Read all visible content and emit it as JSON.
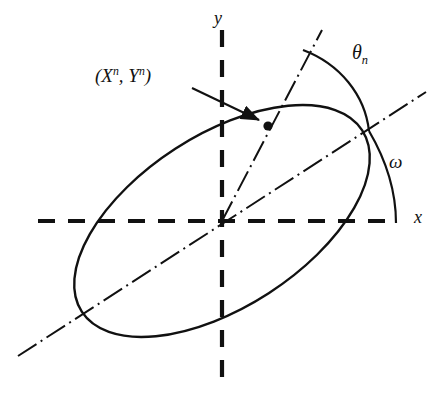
{
  "figure": {
    "type": "geometry-diagram",
    "background_color": "#ffffff",
    "stroke_color": "#111111"
  },
  "labels": {
    "point": {
      "prefix": "(",
      "x_symbol": "X",
      "x_superscript": "n",
      "separator": ", ",
      "y_symbol": "Y",
      "y_superscript": "n",
      "suffix": ")"
    },
    "theta": {
      "symbol": "θ",
      "subscript": "n"
    },
    "omega": {
      "symbol": "ω"
    },
    "x_axis": {
      "symbol": "x"
    },
    "y_axis": {
      "symbol": "y"
    }
  },
  "geometry": {
    "origin": {
      "x": 222,
      "y": 221
    },
    "x_axis_dashed": {
      "x1": 38,
      "y1": 221,
      "x2": 390,
      "y2": 221
    },
    "y_axis_dashed": {
      "x1": 222,
      "y1": 30,
      "x2": 222,
      "y2": 385
    },
    "major_axis_dashdot": {
      "x1": 18,
      "y1": 356,
      "x2": 426,
      "y2": 92
    },
    "radius_dashdot": {
      "x1": 222,
      "y1": 221,
      "x2": 322,
      "y2": 30
    },
    "marked_point": {
      "x": 268,
      "y": 126,
      "radius": 4.5
    },
    "ellipse": {
      "cx": 222,
      "cy": 221,
      "rx": 167,
      "ry": 86,
      "rotation_deg": -32.9
    },
    "theta_arc": {
      "start_x": 303,
      "start_y": 50,
      "end_x": 370,
      "end_y": 131
    },
    "omega_arc": {
      "start_x": 369,
      "start_y": 131,
      "end_x": 396,
      "end_y": 223
    },
    "pointer_arrow": {
      "x1": 192,
      "y1": 88,
      "x2": 262,
      "y2": 122
    }
  }
}
